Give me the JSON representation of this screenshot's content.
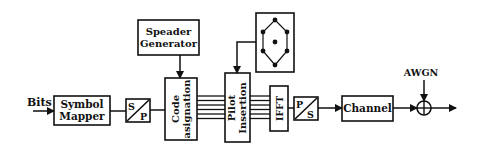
{
  "diagram": {
    "type": "block-diagram",
    "title": "",
    "colors": {
      "stroke": "#111111",
      "background": "#ffffff",
      "text": "#111111"
    },
    "input_label": "Bits",
    "blocks": {
      "symbol_mapper": {
        "line1": "Symbol",
        "line2": "Mapper"
      },
      "serial_to_parallel": {
        "top": "S",
        "bottom": "P"
      },
      "spreader_generator": {
        "line1": "Speader",
        "line2": "Generator"
      },
      "code_assignation": {
        "line1": "Code",
        "line2": "asignation"
      },
      "pilot_insertion": {
        "line1": "Pilot",
        "line2": "Insertion"
      },
      "constellation": {
        "icon": "hexagonal-constellation-icon",
        "points": 7
      },
      "ifft": {
        "label": "IFFT"
      },
      "parallel_to_serial": {
        "top": "P",
        "bottom": "S"
      },
      "channel": {
        "label": "Channel"
      },
      "adder": {
        "icon": "summation-circle-icon"
      }
    },
    "noise_label": "AWGN",
    "parallel_lines": 6,
    "flow": [
      "Bits",
      "Symbol Mapper",
      "S/P",
      "Code asignation",
      "Pilot Insertion",
      "IFFT",
      "P/S",
      "Channel",
      "Adder (+AWGN)",
      "Output"
    ]
  }
}
